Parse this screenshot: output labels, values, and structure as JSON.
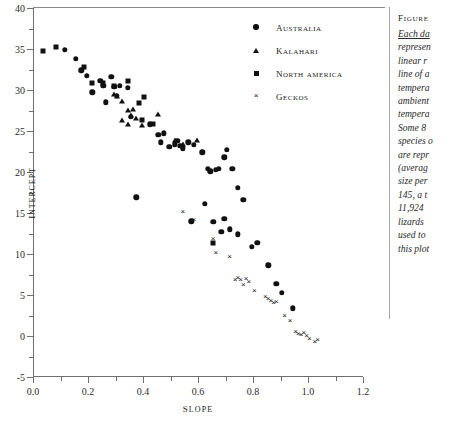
{
  "chart_data": {
    "type": "scatter",
    "title": "",
    "xlabel": "Slope",
    "ylabel": "Intercept",
    "xlim": [
      0.0,
      1.2
    ],
    "ylim": [
      -5,
      40
    ],
    "xticks": [
      "0.0",
      "0.2",
      "0.4",
      "0.6",
      "0.8",
      "1.0",
      "1.2"
    ],
    "xtick_values": [
      0.0,
      0.2,
      0.4,
      0.6,
      0.8,
      1.0,
      1.2
    ],
    "yticks": [
      "40",
      "35",
      "30",
      "25",
      "20",
      "15",
      "10",
      "5",
      "0",
      "-5"
    ],
    "ytick_values": [
      40,
      35,
      30,
      25,
      20,
      15,
      10,
      5,
      0,
      -5
    ],
    "xminor_step": 0.1,
    "yminor_step": 2.5,
    "grid": false,
    "legend_position": "top-right",
    "series": [
      {
        "name": "Australia",
        "marker": "circle",
        "points": [
          [
            0.115,
            34.9
          ],
          [
            0.155,
            33.8
          ],
          [
            0.175,
            32.4
          ],
          [
            0.195,
            31.7
          ],
          [
            0.215,
            29.7
          ],
          [
            0.245,
            31.1
          ],
          [
            0.255,
            30.5
          ],
          [
            0.265,
            28.5
          ],
          [
            0.285,
            31.6
          ],
          [
            0.295,
            30.4
          ],
          [
            0.305,
            29.3
          ],
          [
            0.315,
            30.5
          ],
          [
            0.345,
            30.3
          ],
          [
            0.355,
            26.7
          ],
          [
            0.375,
            16.9
          ],
          [
            0.425,
            25.8
          ],
          [
            0.455,
            24.5
          ],
          [
            0.465,
            23.6
          ],
          [
            0.475,
            24.7
          ],
          [
            0.495,
            23.1
          ],
          [
            0.515,
            23.4
          ],
          [
            0.525,
            23.8
          ],
          [
            0.535,
            23.2
          ],
          [
            0.545,
            22.9
          ],
          [
            0.565,
            23.6
          ],
          [
            0.585,
            23.3
          ],
          [
            0.615,
            22.4
          ],
          [
            0.635,
            20.4
          ],
          [
            0.645,
            20.1
          ],
          [
            0.665,
            20.3
          ],
          [
            0.675,
            20.4
          ],
          [
            0.695,
            21.8
          ],
          [
            0.705,
            22.7
          ],
          [
            0.725,
            20.4
          ],
          [
            0.745,
            18.1
          ],
          [
            0.765,
            16.6
          ],
          [
            0.575,
            14.0
          ],
          [
            0.625,
            16.1
          ],
          [
            0.655,
            13.9
          ],
          [
            0.685,
            12.7
          ],
          [
            0.695,
            14.3
          ],
          [
            0.715,
            13.0
          ],
          [
            0.745,
            12.4
          ],
          [
            0.795,
            10.9
          ],
          [
            0.815,
            11.4
          ],
          [
            0.855,
            8.6
          ],
          [
            0.885,
            6.4
          ],
          [
            0.905,
            5.3
          ],
          [
            0.945,
            3.4
          ]
        ]
      },
      {
        "name": "Kalahari",
        "marker": "triangle",
        "points": [
          [
            0.295,
            29.5
          ],
          [
            0.305,
            29.3
          ],
          [
            0.325,
            28.7
          ],
          [
            0.345,
            27.6
          ],
          [
            0.355,
            26.9
          ],
          [
            0.365,
            27.7
          ],
          [
            0.375,
            26.6
          ],
          [
            0.395,
            25.7
          ],
          [
            0.455,
            27.1
          ],
          [
            0.515,
            23.9
          ],
          [
            0.545,
            23.4
          ],
          [
            0.595,
            23.9
          ],
          [
            0.325,
            26.3
          ],
          [
            0.345,
            25.9
          ]
        ]
      },
      {
        "name": "North America",
        "marker": "square",
        "points": [
          [
            0.035,
            34.7
          ],
          [
            0.085,
            35.3
          ],
          [
            0.185,
            32.8
          ],
          [
            0.215,
            30.8
          ],
          [
            0.255,
            30.9
          ],
          [
            0.295,
            30.5
          ],
          [
            0.345,
            31.1
          ],
          [
            0.385,
            28.4
          ],
          [
            0.395,
            26.4
          ],
          [
            0.405,
            29.2
          ],
          [
            0.435,
            25.9
          ],
          [
            0.655,
            11.4
          ]
        ]
      },
      {
        "name": "Geckos",
        "marker": "cross",
        "points": [
          [
            0.545,
            15.3
          ],
          [
            0.585,
            14.3
          ],
          [
            0.655,
            11.9
          ],
          [
            0.665,
            10.3
          ],
          [
            0.715,
            9.7
          ],
          [
            0.735,
            7.0
          ],
          [
            0.745,
            7.2
          ],
          [
            0.755,
            6.9
          ],
          [
            0.765,
            6.4
          ],
          [
            0.775,
            7.1
          ],
          [
            0.785,
            6.7
          ],
          [
            0.805,
            5.6
          ],
          [
            0.845,
            4.9
          ],
          [
            0.855,
            4.6
          ],
          [
            0.865,
            4.4
          ],
          [
            0.875,
            4.2
          ],
          [
            0.885,
            4.3
          ],
          [
            0.915,
            2.6
          ],
          [
            0.935,
            1.9
          ],
          [
            0.955,
            0.6
          ],
          [
            0.965,
            0.4
          ],
          [
            0.975,
            0.2
          ],
          [
            0.985,
            0.5
          ],
          [
            0.995,
            0.1
          ],
          [
            1.005,
            -0.2
          ],
          [
            1.025,
            -0.6
          ],
          [
            1.035,
            -0.4
          ]
        ]
      }
    ]
  },
  "legend": {
    "items": [
      {
        "label": "Australia",
        "marker": "circle"
      },
      {
        "label": "Kalahari",
        "marker": "triangle"
      },
      {
        "label": "North America",
        "marker": "square"
      },
      {
        "label": "Geckos",
        "marker": "cross"
      }
    ]
  },
  "caption": {
    "title": "Figure",
    "lines": [
      "Each da",
      "represen",
      "linear r",
      "line of a",
      "tempera",
      "ambient",
      "tempera",
      "Some 8",
      "species o",
      "are repr",
      "(averag",
      "size per",
      "145, a t",
      "11,924",
      "lizards ",
      "used to ",
      "this plot"
    ]
  }
}
